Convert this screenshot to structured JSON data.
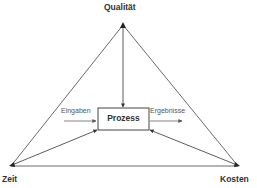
{
  "diagram": {
    "vertices": {
      "top": {
        "label": "Qualität"
      },
      "bottom_left": {
        "label": "Zeit"
      },
      "bottom_right": {
        "label": "Kosten"
      }
    },
    "center_box": {
      "label": "Prozess"
    },
    "inputs_label": "Eingaben",
    "outputs_label": "Ergebnisse",
    "colors": {
      "line": "#333333",
      "box_border": "#444444",
      "flow_arrow": "#777777"
    }
  }
}
